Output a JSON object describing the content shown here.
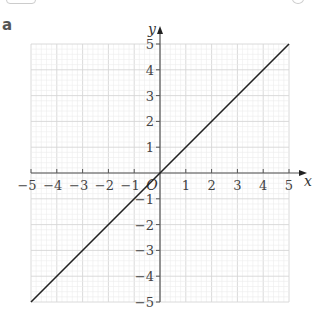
{
  "panel_label": "a",
  "chart_data": {
    "type": "line",
    "title": "",
    "xlabel": "x",
    "ylabel": "y",
    "xlim": [
      -5,
      5
    ],
    "ylim": [
      -5,
      5
    ],
    "grid": true,
    "x_ticks": [
      -5,
      -4,
      -3,
      -2,
      -1,
      1,
      2,
      3,
      4,
      5
    ],
    "y_ticks": [
      -5,
      -4,
      -3,
      -2,
      -1,
      1,
      2,
      3,
      4,
      5
    ],
    "origin_label": "O",
    "series": [
      {
        "name": "y = x",
        "x": [
          -5,
          5
        ],
        "y": [
          -5,
          5
        ],
        "color": "#222222"
      }
    ]
  }
}
